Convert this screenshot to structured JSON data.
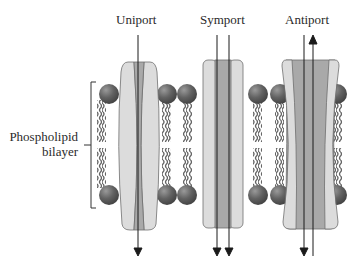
{
  "labels": {
    "uniport": "Uniport",
    "symport": "Symport",
    "antiport": "Antiport",
    "phospholipid_line1": "Phospholipid",
    "phospholipid_line2": "bilayer"
  },
  "colors": {
    "protein_outer": "#d9d9d9",
    "protein_inner": "#a8a8a8",
    "protein_outline": "#6e6e6e",
    "head": "#606060",
    "head_highlight": "#8a8a8a",
    "tail": "#6a6a6a",
    "arrow": "#1a1a1a",
    "text": "#2a2a2a"
  },
  "transporters": [
    {
      "name": "uniport",
      "arrows": [
        {
          "direction": "down"
        }
      ]
    },
    {
      "name": "symport",
      "arrows": [
        {
          "direction": "down"
        },
        {
          "direction": "down"
        }
      ]
    },
    {
      "name": "antiport",
      "arrows": [
        {
          "direction": "down"
        },
        {
          "direction": "up"
        }
      ]
    }
  ]
}
